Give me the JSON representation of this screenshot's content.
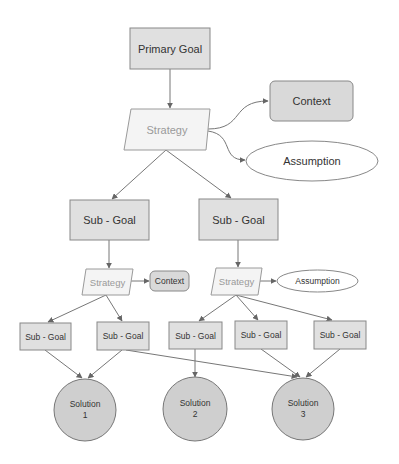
{
  "diagram": {
    "colors": {
      "goal_fill": "#e0e0e0",
      "strategy_fill": "#f4f4f4",
      "strategy_text": "#9a9a9a",
      "context_fill": "#d9d9d9",
      "assumption_fill": "#ffffff",
      "solution_fill": "#cfcfcf",
      "edge": "#777777",
      "text": "#333333"
    },
    "nodes": {
      "primary_goal": {
        "label": "Primary Goal"
      },
      "strategy_top": {
        "label": "Strategy"
      },
      "context_top": {
        "label": "Context"
      },
      "assumption_top": {
        "label": "Assumption"
      },
      "subgoal_left": {
        "label": "Sub - Goal"
      },
      "subgoal_right": {
        "label": "Sub - Goal"
      },
      "strategy_left": {
        "label": "Strategy"
      },
      "context_left": {
        "label": "Context"
      },
      "strategy_right": {
        "label": "Strategy"
      },
      "assumption_right": {
        "label": "Assumption"
      },
      "subgoal_1": {
        "label": "Sub - Goal"
      },
      "subgoal_2": {
        "label": "Sub - Goal"
      },
      "subgoal_3": {
        "label": "Sub - Goal"
      },
      "subgoal_4": {
        "label": "Sub - Goal"
      },
      "subgoal_5": {
        "label": "Sub - Goal"
      },
      "solution_1": {
        "line1": "Solution",
        "line2": "1"
      },
      "solution_2": {
        "line1": "Solution",
        "line2": "2"
      },
      "solution_3": {
        "line1": "Solution",
        "line2": "3"
      }
    },
    "edges": [
      {
        "from": "primary_goal",
        "to": "strategy_top"
      },
      {
        "from": "strategy_top",
        "to": "context_top"
      },
      {
        "from": "strategy_top",
        "to": "assumption_top"
      },
      {
        "from": "strategy_top",
        "to": "subgoal_left"
      },
      {
        "from": "strategy_top",
        "to": "subgoal_right"
      },
      {
        "from": "subgoal_left",
        "to": "strategy_left"
      },
      {
        "from": "strategy_left",
        "to": "context_left"
      },
      {
        "from": "subgoal_right",
        "to": "strategy_right"
      },
      {
        "from": "strategy_right",
        "to": "assumption_right"
      },
      {
        "from": "strategy_left",
        "to": "subgoal_1"
      },
      {
        "from": "strategy_left",
        "to": "subgoal_2"
      },
      {
        "from": "strategy_right",
        "to": "subgoal_3"
      },
      {
        "from": "strategy_right",
        "to": "subgoal_4"
      },
      {
        "from": "strategy_right",
        "to": "subgoal_5"
      },
      {
        "from": "subgoal_1",
        "to": "solution_1"
      },
      {
        "from": "subgoal_2",
        "to": "solution_1"
      },
      {
        "from": "subgoal_2",
        "to": "solution_3"
      },
      {
        "from": "subgoal_3",
        "to": "solution_2"
      },
      {
        "from": "subgoal_4",
        "to": "solution_3"
      },
      {
        "from": "subgoal_5",
        "to": "solution_3"
      }
    ]
  }
}
